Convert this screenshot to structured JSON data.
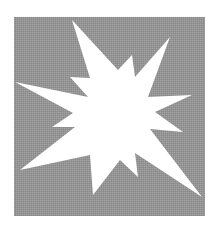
{
  "graphic": {
    "title": "Explosion starburst icon",
    "background_color": "#ffffff",
    "panel": {
      "x": 14,
      "y": 17,
      "width": 191,
      "height": 199,
      "color": "#949494",
      "dither_color": "#a3a3a3"
    },
    "starburst": {
      "color": "#ffffff",
      "points": "72,20 90,78 70,77 88,97 15,82 73,113 52,127 75,127 20,170 90,155 93,195 120,160 138,177 135,153 202,197 150,129 183,132 155,112 192,95 148,97 170,37 135,77 132,55 118,70"
    }
  }
}
